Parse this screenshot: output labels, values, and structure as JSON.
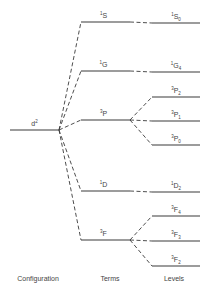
{
  "diagram": {
    "line_color": "#3a3a3a",
    "configuration": {
      "label_base": "d",
      "label_sup": "2",
      "y": 130
    },
    "terms": [
      {
        "mult": "1",
        "letter": "S",
        "y": 22
      },
      {
        "mult": "1",
        "letter": "G",
        "y": 71
      },
      {
        "mult": "3",
        "letter": "P",
        "y": 120
      },
      {
        "mult": "1",
        "letter": "D",
        "y": 191
      },
      {
        "mult": "3",
        "letter": "F",
        "y": 240
      }
    ],
    "levels": [
      {
        "mult": "1",
        "letter": "S",
        "j": "0",
        "y": 23,
        "term": 0
      },
      {
        "mult": "1",
        "letter": "G",
        "j": "4",
        "y": 72,
        "term": 1
      },
      {
        "mult": "3",
        "letter": "P",
        "j": "2",
        "y": 97,
        "term": 2
      },
      {
        "mult": "3",
        "letter": "P",
        "j": "1",
        "y": 121,
        "term": 2
      },
      {
        "mult": "3",
        "letter": "P",
        "j": "0",
        "y": 145,
        "term": 2
      },
      {
        "mult": "1",
        "letter": "D",
        "j": "2",
        "y": 192,
        "term": 3
      },
      {
        "mult": "3",
        "letter": "F",
        "j": "4",
        "y": 216,
        "term": 4
      },
      {
        "mult": "3",
        "letter": "F",
        "j": "3",
        "y": 241,
        "term": 4
      },
      {
        "mult": "3",
        "letter": "F",
        "j": "2",
        "y": 266,
        "term": 4
      }
    ],
    "column_labels": {
      "configuration": "Configuration",
      "terms": "Terms",
      "levels": "Levels"
    }
  }
}
